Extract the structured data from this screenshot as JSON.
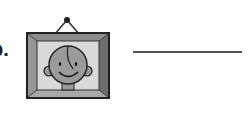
{
  "question": {
    "label": "b.",
    "image": {
      "subject": "framed-portrait-of-smiling-child",
      "frame_color": "#7a7a7a",
      "background_color": "#d9d9d9",
      "face_color": "#9a9a9a"
    },
    "answer_line": {
      "value": "",
      "color": "#555555"
    }
  }
}
